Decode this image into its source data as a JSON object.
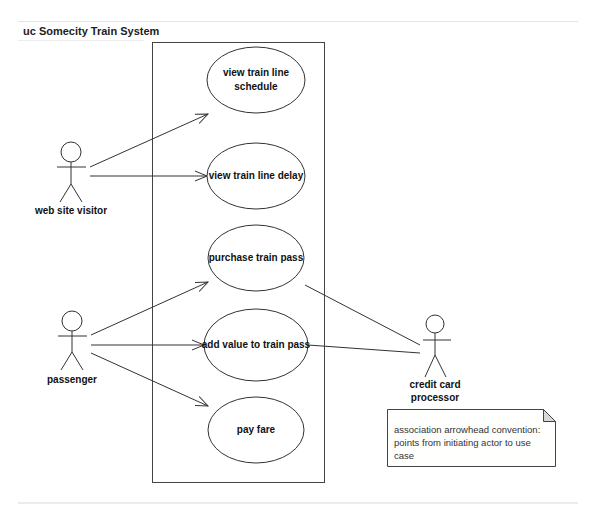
{
  "diagram": {
    "frame_title": "uc Somecity Train System",
    "system_boundary": {
      "x": 152,
      "y": 42,
      "width": 173,
      "height": 441
    },
    "actors": [
      {
        "id": "web-site-visitor",
        "label": "web site visitor",
        "head": [
          71,
          152
        ]
      },
      {
        "id": "passenger",
        "label": "passenger",
        "head": [
          72,
          321
        ]
      },
      {
        "id": "credit-card-processor",
        "label_line1": "credit card",
        "label_line2": "processor",
        "head": [
          435,
          324
        ]
      }
    ],
    "use_cases": [
      {
        "id": "view-train-line-schedule",
        "line1": "view train line",
        "line2": "schedule",
        "cx": 256,
        "cy": 80
      },
      {
        "id": "view-train-line-delay",
        "label": "view train line delay",
        "cx": 256,
        "cy": 176
      },
      {
        "id": "purchase-train-pass",
        "label": "purchase train pass",
        "cx": 256,
        "cy": 258
      },
      {
        "id": "add-value-to-train-pass",
        "label": "add value to train pass",
        "cx": 256,
        "cy": 345
      },
      {
        "id": "pay-fare",
        "label": "pay fare",
        "cx": 256,
        "cy": 430
      }
    ],
    "associations": [
      {
        "from": "web-site-visitor",
        "to": "view-train-line-schedule",
        "arrow": true
      },
      {
        "from": "web-site-visitor",
        "to": "view-train-line-delay",
        "arrow": true
      },
      {
        "from": "passenger",
        "to": "purchase-train-pass",
        "arrow": true
      },
      {
        "from": "passenger",
        "to": "add-value-to-train-pass",
        "arrow": true
      },
      {
        "from": "passenger",
        "to": "pay-fare",
        "arrow": true
      },
      {
        "from": "purchase-train-pass",
        "to": "credit-card-processor",
        "arrow": false
      },
      {
        "from": "add-value-to-train-pass",
        "to": "credit-card-processor",
        "arrow": false
      }
    ],
    "note": {
      "text": "association arrowhead convention: points from initiating actor to use case"
    },
    "colors": {
      "line": "#333333",
      "frame": "#e4e4e4",
      "note_fold": "#d8d8d8"
    }
  }
}
